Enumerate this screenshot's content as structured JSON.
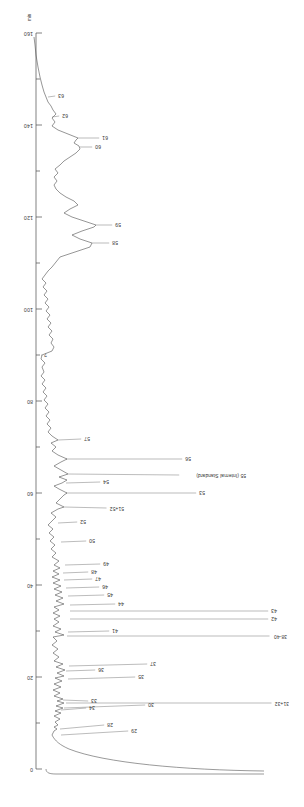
{
  "figure": {
    "rotation_degrees": 180,
    "background_color": "#ffffff",
    "trace_color": "#555555",
    "axis_color": "#4a4a4a"
  },
  "axis": {
    "unit_label": "min",
    "orientation": "vertical-right",
    "ticks": [
      {
        "value": "0",
        "y": 38
      },
      {
        "value": "20",
        "y": 130
      },
      {
        "value": "40",
        "y": 222
      },
      {
        "value": "60",
        "y": 314
      },
      {
        "value": "80",
        "y": 406
      },
      {
        "value": "100",
        "y": 498
      },
      {
        "value": "120",
        "y": 590
      },
      {
        "value": "140",
        "y": 682
      },
      {
        "value": "160",
        "y": 774
      }
    ],
    "minor_ticks": [
      84,
      176,
      268,
      360,
      452,
      544,
      636,
      728
    ]
  },
  "chart_data": {
    "type": "line",
    "title": "",
    "xlabel": "min",
    "ylabel": "",
    "xlim": [
      0,
      165
    ],
    "grid": false,
    "legend": "none",
    "series": [
      {
        "name": "chromatogram",
        "x": [
          0,
          2,
          4,
          6,
          8,
          10,
          12,
          14,
          16,
          18,
          20,
          22,
          24,
          26,
          28,
          30,
          32,
          34,
          36,
          38,
          40,
          42,
          44,
          46,
          48,
          50,
          52,
          54,
          56,
          58,
          60,
          62,
          64,
          66,
          68,
          70,
          72,
          74,
          76,
          78,
          80,
          85,
          90,
          95,
          100,
          105,
          110,
          115,
          120,
          125,
          130,
          135,
          140,
          145,
          150,
          155,
          160
        ],
        "y": [
          2,
          2,
          3,
          4,
          6,
          10,
          18,
          35,
          62,
          88,
          96,
          70,
          48,
          60,
          82,
          55,
          40,
          58,
          75,
          45,
          38,
          62,
          50,
          42,
          58,
          88,
          66,
          96,
          72,
          95,
          60,
          44,
          38,
          30,
          26,
          24,
          22,
          21,
          20,
          20,
          19,
          18,
          18,
          17,
          17,
          16,
          16,
          15,
          35,
          52,
          28,
          20,
          18,
          30,
          24,
          14,
          6
        ]
      }
    ],
    "peaks": [
      {
        "label": "28",
        "label_x": 191,
        "label_y": 82,
        "tip_x": 244,
        "tip_y": 78
      },
      {
        "label": "29",
        "label_x": 167,
        "label_y": 76,
        "tip_x": 243,
        "tip_y": 72
      },
      {
        "label": "30",
        "label_x": 150,
        "label_y": 102,
        "tip_x": 240,
        "tip_y": 99
      },
      {
        "label": "31+32",
        "label_x": 15,
        "label_y": 104,
        "tip_x": 238,
        "tip_y": 104
      },
      {
        "label": "33",
        "label_x": 207,
        "label_y": 106,
        "tip_x": 241,
        "tip_y": 107
      },
      {
        "label": "34",
        "label_x": 209,
        "label_y": 99,
        "tip_x": 243,
        "tip_y": 97
      },
      {
        "label": "35",
        "label_x": 160,
        "label_y": 130,
        "tip_x": 236,
        "tip_y": 128
      },
      {
        "label": "36",
        "label_x": 200,
        "label_y": 137,
        "tip_x": 238,
        "tip_y": 136
      },
      {
        "label": "37",
        "label_x": 148,
        "label_y": 143,
        "tip_x": 235,
        "tip_y": 141
      },
      {
        "label": "38-40",
        "label_x": 17,
        "label_y": 171,
        "tip_x": 237,
        "tip_y": 171
      },
      {
        "label": "41",
        "label_x": 186,
        "label_y": 176,
        "tip_x": 236,
        "tip_y": 175
      },
      {
        "label": "42",
        "label_x": 27,
        "label_y": 188,
        "tip_x": 234,
        "tip_y": 188
      },
      {
        "label": "43",
        "label_x": 27,
        "label_y": 196,
        "tip_x": 234,
        "tip_y": 196
      },
      {
        "label": "44",
        "label_x": 180,
        "label_y": 203,
        "tip_x": 234,
        "tip_y": 202
      },
      {
        "label": "45",
        "label_x": 191,
        "label_y": 212,
        "tip_x": 236,
        "tip_y": 211
      },
      {
        "label": "46",
        "label_x": 196,
        "label_y": 220,
        "tip_x": 238,
        "tip_y": 219
      },
      {
        "label": "47",
        "label_x": 203,
        "label_y": 228,
        "tip_x": 240,
        "tip_y": 227
      },
      {
        "label": "48",
        "label_x": 207,
        "label_y": 235,
        "tip_x": 241,
        "tip_y": 234
      },
      {
        "label": "49",
        "label_x": 195,
        "label_y": 243,
        "tip_x": 239,
        "tip_y": 242
      },
      {
        "label": "50",
        "label_x": 209,
        "label_y": 266,
        "tip_x": 243,
        "tip_y": 265
      },
      {
        "label": "52",
        "label_x": 218,
        "label_y": 285,
        "tip_x": 246,
        "tip_y": 284
      },
      {
        "label": "51+52",
        "label_x": 180,
        "label_y": 299,
        "tip_x": 240,
        "tip_y": 300
      },
      {
        "label": "53",
        "label_x": 99,
        "label_y": 314,
        "tip_x": 238,
        "tip_y": 314
      },
      {
        "label": "54",
        "label_x": 195,
        "label_y": 325,
        "tip_x": 238,
        "tip_y": 324
      },
      {
        "label": "55 (Internal Standard)",
        "label_x": 58,
        "label_y": 332,
        "tip_x": 236,
        "tip_y": 333
      },
      {
        "label": "56",
        "label_x": 113,
        "label_y": 348,
        "tip_x": 238,
        "tip_y": 348
      },
      {
        "label": "57",
        "label_x": 214,
        "label_y": 368,
        "tip_x": 246,
        "tip_y": 367
      },
      {
        "label": "?",
        "label_x": 257,
        "label_y": 452,
        "tip_x": 262,
        "tip_y": 452
      },
      {
        "label": "58",
        "label_x": 186,
        "label_y": 564,
        "tip_x": 212,
        "tip_y": 564
      },
      {
        "label": "59",
        "label_x": 183,
        "label_y": 582,
        "tip_x": 208,
        "tip_y": 582
      },
      {
        "label": "60",
        "label_x": 203,
        "label_y": 660,
        "tip_x": 224,
        "tip_y": 660
      },
      {
        "label": "61",
        "label_x": 196,
        "label_y": 669,
        "tip_x": 226,
        "tip_y": 669
      },
      {
        "label": "62",
        "label_x": 236,
        "label_y": 691,
        "tip_x": 252,
        "tip_y": 690
      },
      {
        "label": "63",
        "label_x": 240,
        "label_y": 711,
        "tip_x": 256,
        "tip_y": 710
      }
    ]
  }
}
